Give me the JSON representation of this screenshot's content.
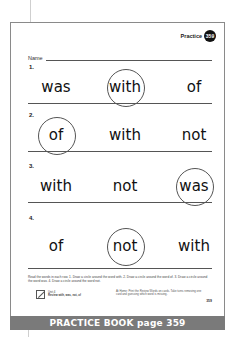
{
  "header": {
    "practice_label": "Practice",
    "practice_number": "359"
  },
  "name_label": "Name",
  "rows": [
    {
      "number": "1.",
      "words": [
        {
          "text": "was",
          "circled": false
        },
        {
          "text": "with",
          "circled": true
        },
        {
          "text": "of",
          "circled": false
        }
      ]
    },
    {
      "number": "2.",
      "words": [
        {
          "text": "of",
          "circled": true
        },
        {
          "text": "with",
          "circled": false
        },
        {
          "text": "not",
          "circled": false
        }
      ]
    },
    {
      "number": "3.",
      "words": [
        {
          "text": "with",
          "circled": false
        },
        {
          "text": "not",
          "circled": false
        },
        {
          "text": "was",
          "circled": true
        }
      ]
    },
    {
      "number": "4.",
      "words": [
        {
          "text": "of",
          "circled": false
        },
        {
          "text": "not",
          "circled": true
        },
        {
          "text": "with",
          "circled": false
        }
      ]
    }
  ],
  "instructions": "Read the words in each row. 1. Draw a circle around the word with. 2. Draw a circle around the word of. 3. Draw a circle around the word was. 4. Draw a circle around the word not.",
  "footer": {
    "unit_label": "Unit 4",
    "unit_review": "Review with, was, not, of",
    "at_home": "At Home: Print the Review Words on cards. Take turns removing one card and guessing which word is missing.",
    "page_number": "359"
  },
  "side_text": "McGraw-Hill School Division",
  "banner": "PRACTICE BOOK page 359"
}
